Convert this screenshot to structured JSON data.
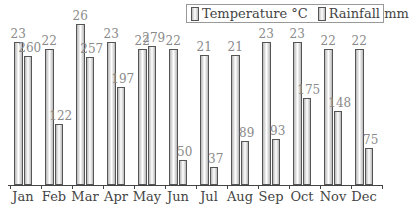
{
  "chart_data": {
    "type": "bar",
    "title": "",
    "xlabel": "",
    "ylabel": "",
    "categories": [
      "Jan",
      "Feb",
      "Mar",
      "Apr",
      "May",
      "Jun",
      "Jul",
      "Aug",
      "Sep",
      "Oct",
      "Nov",
      "Dec"
    ],
    "series": [
      {
        "name": "Temperature °C",
        "values": [
          23,
          22,
          26,
          23,
          22,
          22,
          21,
          21,
          23,
          23,
          22,
          22
        ]
      },
      {
        "name": "Rainfall mm",
        "values": [
          260,
          122,
          257,
          197,
          279,
          50,
          37,
          89,
          93,
          175,
          148,
          75
        ]
      }
    ],
    "grid": false,
    "legend_position": "top-right",
    "data_labels": true
  },
  "legend": {
    "temperature": "Temperature °C",
    "rainfall": "Rainfall mm"
  }
}
